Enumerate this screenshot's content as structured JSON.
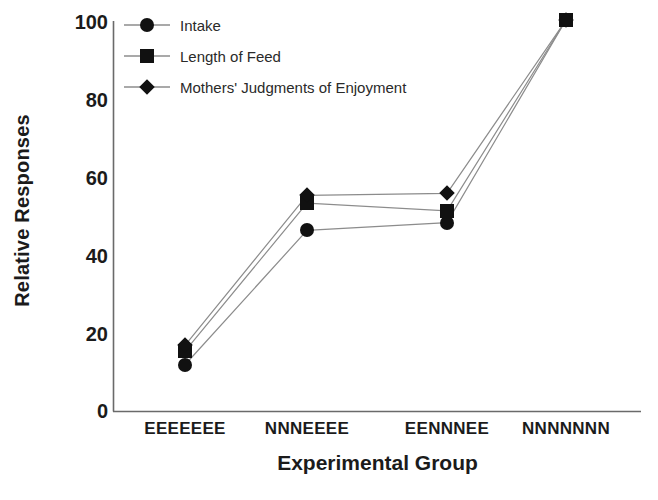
{
  "chart_data": {
    "type": "line",
    "title": "",
    "xlabel": "Experimental Group",
    "ylabel": "Relative Responses",
    "categories": [
      "EEEEEEE",
      "NNNEEEE",
      "EENNNEE",
      "NNNNNNN"
    ],
    "ylim": [
      0,
      100
    ],
    "yticks": [
      0,
      20,
      40,
      60,
      80,
      100
    ],
    "ytick_labels": [
      "0",
      "20",
      "40",
      "60",
      "80",
      "100"
    ],
    "grid": false,
    "legend_position": "top-left-inside",
    "series": [
      {
        "name": "Intake",
        "marker": "circle",
        "color": "#111111",
        "values": [
          12,
          46.5,
          48.5,
          100.5
        ]
      },
      {
        "name": "Length of Feed",
        "marker": "square",
        "color": "#111111",
        "values": [
          15.5,
          53.5,
          51.5,
          100.5
        ]
      },
      {
        "name": "Mothers' Judgments of Enjoyment",
        "marker": "diamond",
        "color": "#111111",
        "values": [
          17,
          55.5,
          56,
          100.5
        ]
      }
    ]
  },
  "axes": {
    "ylabel": "Relative Responses",
    "xlabel": "Experimental Group",
    "ytick_labels": [
      "100",
      "80",
      "60",
      "40",
      "20",
      "0"
    ],
    "xtick_labels": [
      "EEEEEEE",
      "NNNEEEE",
      "EENNNEE",
      "NNNNNNN"
    ]
  },
  "legend": {
    "items": [
      {
        "label": "Intake",
        "marker": "circle-marker"
      },
      {
        "label": "Length of Feed",
        "marker": "square-marker"
      },
      {
        "label": "Mothers' Judgments of Enjoyment",
        "marker": "diamond-marker"
      }
    ]
  }
}
